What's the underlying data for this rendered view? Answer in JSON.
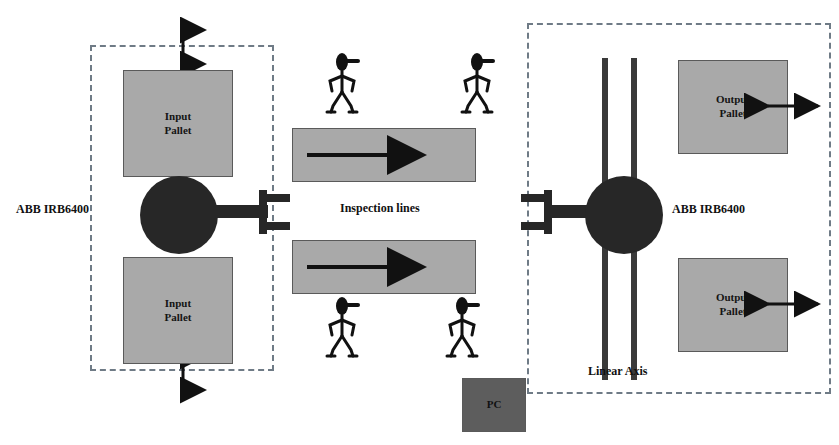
{
  "diagram": {
    "colors": {
      "pallet_fill": "#a9a9a9",
      "pc_fill": "#5d5d5d",
      "robot_fill": "#272727",
      "boundary": "#6f7b86",
      "text": "#111111",
      "background": "#ffffff"
    },
    "left_cell": {
      "robot_label": "ABB IRB6400",
      "pallets": [
        {
          "label": "Input\nPallet"
        },
        {
          "label": "Input\nPallet"
        }
      ]
    },
    "center": {
      "inspection_label": "Inspection lines",
      "conveyors": [
        {
          "flow": "left-to-right"
        },
        {
          "flow": "left-to-right"
        }
      ],
      "operators": [
        {
          "name": "operator-top-left"
        },
        {
          "name": "operator-top-right"
        },
        {
          "name": "operator-bottom-left"
        },
        {
          "name": "operator-bottom-right"
        }
      ],
      "pc_label": "PC"
    },
    "right_cell": {
      "robot_label": "ABB IRB6400",
      "linear_axis_label": "Linear Axis",
      "pallets": [
        {
          "label": "Output\nPallet"
        },
        {
          "label": "Output\nPallet"
        }
      ]
    }
  }
}
